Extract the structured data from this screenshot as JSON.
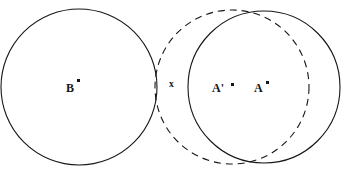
{
  "figure": {
    "canvas": {
      "width": 345,
      "height": 178,
      "background": "#ffffff"
    },
    "stroke_color": "#15161a",
    "circles": [
      {
        "id": "circle-b",
        "label": "B",
        "style": "solid",
        "cx": 79,
        "cy": 87,
        "r": 78,
        "stroke_width": 1.1,
        "dash": ""
      },
      {
        "id": "circle-a-prime",
        "label": "A'",
        "style": "dashed",
        "cx": 232,
        "cy": 87,
        "r": 77,
        "stroke_width": 1.1,
        "dash": "7,5"
      },
      {
        "id": "circle-a",
        "label": "A",
        "style": "solid",
        "cx": 264,
        "cy": 87,
        "r": 76,
        "stroke_width": 1.1,
        "dash": ""
      }
    ],
    "labels": [
      {
        "id": "label-b",
        "text": "B",
        "x": 66,
        "y": 82
      },
      {
        "id": "label-x",
        "text": "x",
        "x": 169,
        "y": 80
      },
      {
        "id": "label-a-prime",
        "text": "A'",
        "x": 212,
        "y": 82
      },
      {
        "id": "label-a",
        "text": "A",
        "x": 254,
        "y": 82
      }
    ],
    "center_points": [
      {
        "id": "dot-b",
        "for": "B",
        "x": 77,
        "y": 79
      },
      {
        "id": "dot-a-prime",
        "for": "A'",
        "x": 231,
        "y": 83
      },
      {
        "id": "dot-a",
        "for": "A",
        "x": 266,
        "y": 81
      }
    ]
  }
}
